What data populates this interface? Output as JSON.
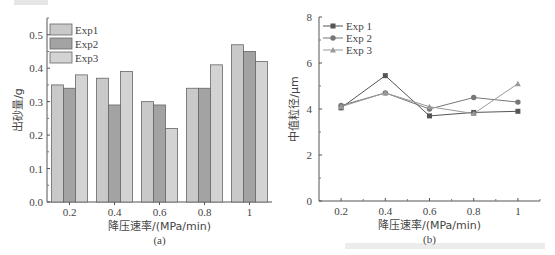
{
  "chart_data": [
    {
      "type": "bar",
      "panel_label": "(a)",
      "title": "",
      "xlabel": "降压速率/(MPa/min)",
      "ylabel": "出砂量/g",
      "categories": [
        "0.2",
        "0.4",
        "0.6",
        "0.8",
        "1"
      ],
      "series": [
        {
          "name": "Exp1",
          "values": [
            0.35,
            0.37,
            0.3,
            0.34,
            0.47
          ],
          "color": "#c9c9c9"
        },
        {
          "name": "Exp2",
          "values": [
            0.34,
            0.29,
            0.29,
            0.34,
            0.45
          ],
          "color": "#a3a3a3"
        },
        {
          "name": "Exp3",
          "values": [
            0.38,
            0.39,
            0.22,
            0.41,
            0.42
          ],
          "color": "#d3d3d3"
        }
      ],
      "yticks": [
        "0.0",
        "0.1",
        "0.2",
        "0.3",
        "0.4",
        "0.5"
      ],
      "ylim": [
        0,
        0.55
      ],
      "grid": false,
      "legend_position": "upper left"
    },
    {
      "type": "line",
      "panel_label": "(b)",
      "title": "",
      "xlabel": "降压速率/(MPa/min)",
      "ylabel": "中值粒径/μm",
      "x": [
        0.2,
        0.4,
        0.6,
        0.8,
        1
      ],
      "xticks": [
        "0.2",
        "0.4",
        "0.6",
        "0.8",
        "1"
      ],
      "series": [
        {
          "name": "Exp 1",
          "marker": "square",
          "values": [
            4.05,
            5.45,
            3.7,
            3.85,
            3.9
          ],
          "color": "#555555"
        },
        {
          "name": "Exp 2",
          "marker": "circle",
          "values": [
            4.15,
            4.7,
            4.0,
            4.5,
            4.3
          ],
          "color": "#777777"
        },
        {
          "name": "Exp 3",
          "marker": "triangle",
          "values": [
            4.1,
            4.7,
            4.1,
            3.8,
            5.1
          ],
          "color": "#999999"
        }
      ],
      "yticks": [
        "0",
        "2",
        "4",
        "6",
        "8"
      ],
      "ylim": [
        0,
        8
      ],
      "xlim": [
        0.1,
        1.1
      ],
      "grid": false,
      "legend_position": "upper left"
    }
  ]
}
